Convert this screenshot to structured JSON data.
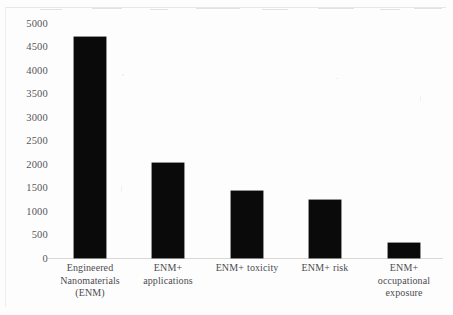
{
  "chart_data": {
    "type": "bar",
    "title": "",
    "subtitle": "",
    "xlabel": "",
    "ylabel": "",
    "ylim": [
      0,
      5000
    ],
    "grid": false,
    "legend": false,
    "categories": [
      "Engineered Nanomaterials (ENM)",
      "ENM+ applications",
      "ENM+ toxicity",
      "ENM+ risk",
      "ENM+ occupational exposure"
    ],
    "category_lines": [
      [
        "Engineered",
        "Nanomaterials",
        "(ENM)"
      ],
      [
        "ENM+",
        "applications"
      ],
      [
        "ENM+ toxicity"
      ],
      [
        "ENM+ risk"
      ],
      [
        "ENM+",
        "occupational",
        "exposure"
      ]
    ],
    "values": [
      4720,
      2030,
      1430,
      1250,
      330
    ],
    "y_ticks": [
      "5000",
      "4500",
      "4000",
      "3500",
      "3000",
      "2500",
      "2000",
      "1500",
      "1000",
      "500",
      "0"
    ],
    "y_tick_values": [
      5000,
      4500,
      4000,
      3500,
      3000,
      2500,
      2000,
      1500,
      1000,
      500,
      0
    ],
    "bar_color": "#0a0a0a",
    "background_color": "#fdfdfd",
    "axis_color": "#d8d8d4",
    "tick_label_color": "#56565a"
  }
}
